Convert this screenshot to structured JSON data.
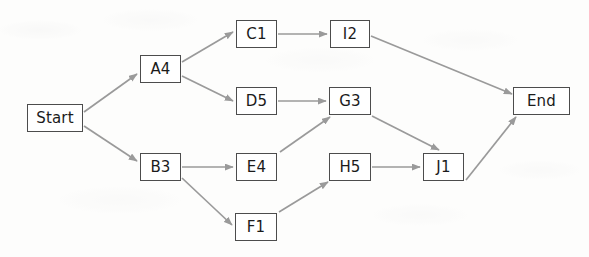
{
  "diagram": {
    "type": "flowchart",
    "background_color": "#fdfdfc",
    "node_fill": "#ffffff",
    "node_border_color": "#4c4c4c",
    "edge_color": "#9a9a9a",
    "text_color": "#1b1b1b",
    "nodes": [
      {
        "id": "start",
        "label": "Start",
        "x": 27,
        "y": 104,
        "w": 56,
        "h": 28
      },
      {
        "id": "a4",
        "label": "A4",
        "x": 140,
        "y": 55,
        "w": 41,
        "h": 28
      },
      {
        "id": "b3",
        "label": "B3",
        "x": 140,
        "y": 153,
        "w": 41,
        "h": 28
      },
      {
        "id": "c1",
        "label": "C1",
        "x": 236,
        "y": 20,
        "w": 41,
        "h": 28
      },
      {
        "id": "d5",
        "label": "D5",
        "x": 236,
        "y": 87,
        "w": 41,
        "h": 28
      },
      {
        "id": "e4",
        "label": "E4",
        "x": 236,
        "y": 153,
        "w": 41,
        "h": 28
      },
      {
        "id": "f1",
        "label": "F1",
        "x": 235,
        "y": 213,
        "w": 42,
        "h": 28
      },
      {
        "id": "i2",
        "label": "I2",
        "x": 330,
        "y": 20,
        "w": 40,
        "h": 28
      },
      {
        "id": "g3",
        "label": "G3",
        "x": 329,
        "y": 87,
        "w": 42,
        "h": 28
      },
      {
        "id": "h5",
        "label": "H5",
        "x": 329,
        "y": 153,
        "w": 42,
        "h": 28
      },
      {
        "id": "j1",
        "label": "J1",
        "x": 423,
        "y": 153,
        "w": 41,
        "h": 28
      },
      {
        "id": "end",
        "label": "End",
        "x": 513,
        "y": 87,
        "w": 57,
        "h": 28
      }
    ],
    "edges": [
      {
        "from": "start",
        "to": "a4",
        "x1": 84,
        "y1": 112,
        "x2": 137,
        "y2": 74
      },
      {
        "from": "start",
        "to": "b3",
        "x1": 84,
        "y1": 126,
        "x2": 137,
        "y2": 161
      },
      {
        "from": "a4",
        "to": "c1",
        "x1": 182,
        "y1": 62,
        "x2": 233,
        "y2": 32
      },
      {
        "from": "a4",
        "to": "d5",
        "x1": 182,
        "y1": 76,
        "x2": 233,
        "y2": 101
      },
      {
        "from": "b3",
        "to": "e4",
        "x1": 182,
        "y1": 167,
        "x2": 233,
        "y2": 167
      },
      {
        "from": "b3",
        "to": "f1",
        "x1": 182,
        "y1": 178,
        "x2": 232,
        "y2": 225
      },
      {
        "from": "c1",
        "to": "i2",
        "x1": 278,
        "y1": 34,
        "x2": 327,
        "y2": 34
      },
      {
        "from": "d5",
        "to": "g3",
        "x1": 278,
        "y1": 101,
        "x2": 326,
        "y2": 101
      },
      {
        "from": "e4",
        "to": "g3",
        "x1": 280,
        "y1": 152,
        "x2": 330,
        "y2": 117
      },
      {
        "from": "f1",
        "to": "h5",
        "x1": 279,
        "y1": 212,
        "x2": 328,
        "y2": 182
      },
      {
        "from": "g3",
        "to": "j1",
        "x1": 372,
        "y1": 116,
        "x2": 439,
        "y2": 150
      },
      {
        "from": "h5",
        "to": "j1",
        "x1": 372,
        "y1": 167,
        "x2": 420,
        "y2": 167
      },
      {
        "from": "i2",
        "to": "end",
        "x1": 371,
        "y1": 36,
        "x2": 512,
        "y2": 94
      },
      {
        "from": "j1",
        "to": "end",
        "x1": 466,
        "y1": 180,
        "x2": 516,
        "y2": 117
      }
    ]
  }
}
